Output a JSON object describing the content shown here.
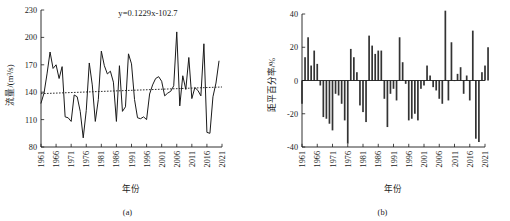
{
  "figure": {
    "panels": [
      {
        "caption": "(a)",
        "annotation": "y=0.1229x-102.7"
      },
      {
        "caption": "(b)"
      }
    ]
  },
  "chart_data": [
    {
      "type": "line",
      "title": "",
      "panel": "(a)",
      "xlabel": "年份",
      "ylabel": "流量/(m³/s)",
      "annotation": "y=0.1229x-102.7",
      "grid": false,
      "legend": "none",
      "xlim": [
        1961,
        2021
      ],
      "ylim": [
        80,
        230
      ],
      "yticks": [
        80,
        110,
        140,
        170,
        200,
        230
      ],
      "xticks": [
        1961,
        1966,
        1971,
        1976,
        1981,
        1986,
        1991,
        1996,
        2001,
        2006,
        2011,
        2016,
        2021
      ],
      "x": [
        1961,
        1962,
        1963,
        1964,
        1965,
        1966,
        1967,
        1968,
        1969,
        1970,
        1971,
        1972,
        1973,
        1974,
        1975,
        1976,
        1977,
        1978,
        1979,
        1980,
        1981,
        1982,
        1983,
        1984,
        1985,
        1986,
        1987,
        1988,
        1989,
        1990,
        1991,
        1992,
        1993,
        1994,
        1995,
        1996,
        1997,
        1998,
        1999,
        2000,
        2001,
        2002,
        2003,
        2004,
        2005,
        2006,
        2007,
        2008,
        2009,
        2010,
        2011,
        2012,
        2013,
        2014,
        2015,
        2016,
        2017,
        2018,
        2019,
        2020
      ],
      "series": [
        {
          "name": "流量",
          "values": [
            128,
            139,
            160,
            184,
            166,
            170,
            155,
            168,
            113,
            112,
            108,
            137,
            135,
            119,
            90,
            120,
            172,
            148,
            108,
            132,
            185,
            169,
            160,
            163,
            151,
            108,
            169,
            119,
            124,
            182,
            171,
            132,
            112,
            111,
            113,
            110,
            138,
            148,
            155,
            157,
            152,
            136,
            139,
            141,
            147,
            206,
            125,
            158,
            143,
            178,
            133,
            145,
            142,
            136,
            193,
            96,
            95,
            135,
            150,
            174
          ]
        }
      ],
      "trend": {
        "name": "线性趋势",
        "equation": "y=0.1229x-102.7",
        "slope": 0.1229,
        "intercept": -102.7,
        "style": "dotted",
        "y_start": 138.4,
        "y_end": 145.7
      }
    },
    {
      "type": "bar",
      "title": "",
      "panel": "(b)",
      "xlabel": "年份",
      "ylabel": "距平百分率/%",
      "grid": false,
      "legend": "none",
      "xlim": [
        1961,
        2021
      ],
      "ylim": [
        -40,
        40
      ],
      "yticks": [
        -40,
        -20,
        0,
        20,
        40
      ],
      "xticks": [
        1961,
        1966,
        1971,
        1976,
        1981,
        1986,
        1991,
        1996,
        2001,
        2006,
        2011,
        2016,
        2021
      ],
      "categories": [
        1961,
        1962,
        1963,
        1964,
        1965,
        1966,
        1967,
        1968,
        1969,
        1970,
        1971,
        1972,
        1973,
        1974,
        1975,
        1976,
        1977,
        1978,
        1979,
        1980,
        1981,
        1982,
        1983,
        1984,
        1985,
        1986,
        1987,
        1988,
        1989,
        1990,
        1991,
        1992,
        1993,
        1994,
        1995,
        1996,
        1997,
        1998,
        1999,
        2000,
        2001,
        2002,
        2003,
        2004,
        2005,
        2006,
        2007,
        2008,
        2009,
        2010,
        2011,
        2012,
        2013,
        2014,
        2015,
        2016,
        2017,
        2018,
        2019,
        2020
      ],
      "values": [
        -14,
        14,
        26,
        9,
        18,
        10,
        -3,
        -22,
        -23,
        -26,
        -30,
        -8,
        -9,
        -14,
        -24,
        -38,
        19,
        14,
        5,
        -15,
        -19,
        -25,
        27,
        21,
        16,
        18,
        18,
        -11,
        -28,
        -8,
        -5,
        -12,
        26,
        11,
        -2,
        -24,
        -23,
        -20,
        -24,
        -5,
        -3,
        9,
        3,
        -4,
        -6,
        -11,
        -14,
        42,
        -12,
        23,
        0,
        4,
        8,
        -8,
        3,
        -12,
        30,
        -35,
        -37,
        5,
        9,
        20
      ]
    }
  ]
}
